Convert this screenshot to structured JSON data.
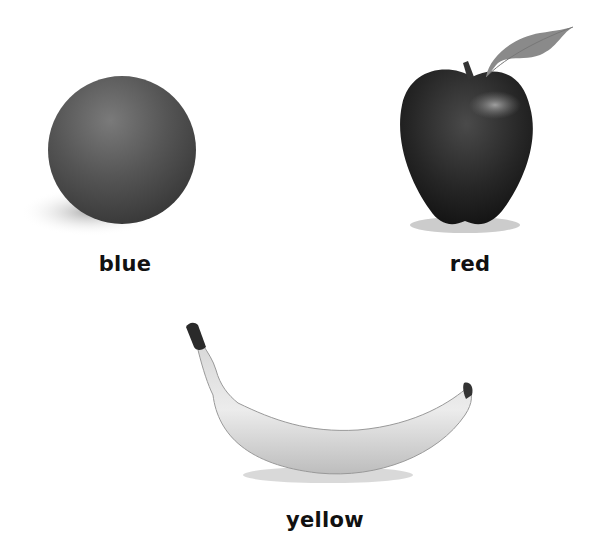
{
  "items": [
    {
      "name": "ball",
      "label": "blue"
    },
    {
      "name": "apple",
      "label": "red"
    },
    {
      "name": "banana",
      "label": "yellow"
    }
  ]
}
